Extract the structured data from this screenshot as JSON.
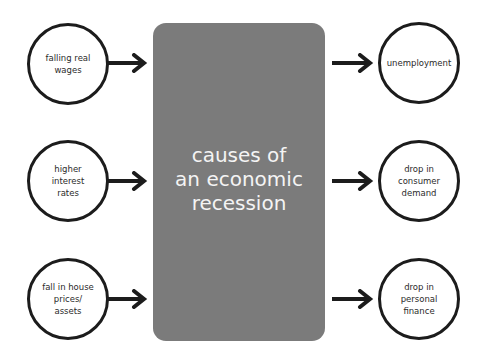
{
  "diagram": {
    "title": "causes of an economic recession",
    "title_lines": [
      "causes of",
      "an economic",
      "recession"
    ],
    "center_box_color": "#7b7b7b",
    "title_color": "#f4f4f4",
    "causes": [
      {
        "label": "falling real wages",
        "lines": [
          "falling real",
          "wages"
        ]
      },
      {
        "label": "higher interest rates",
        "lines": [
          "higher",
          "interest",
          "rates"
        ]
      },
      {
        "label": "fall in house prices/ assets",
        "lines": [
          "fall in house",
          "prices/",
          "assets"
        ]
      }
    ],
    "effects": [
      {
        "label": "unemployment",
        "lines": [
          "unemployment"
        ]
      },
      {
        "label": "drop in consumer demand",
        "lines": [
          "drop in",
          "consumer",
          "demand"
        ]
      },
      {
        "label": "drop in personal finance",
        "lines": [
          "drop in",
          "personal",
          "finance"
        ]
      }
    ],
    "arrow_icon": "right-arrow-icon",
    "stroke_color": "#1c1c1c"
  }
}
